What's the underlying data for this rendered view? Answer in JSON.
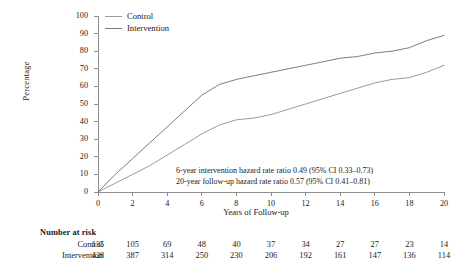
{
  "chart_data": {
    "type": "line",
    "title": "",
    "xlabel": "Years of Follow-up",
    "ylabel": "Percentage",
    "xlim": [
      0,
      20
    ],
    "ylim": [
      0,
      100
    ],
    "xticks": [
      0,
      2,
      4,
      6,
      8,
      10,
      12,
      14,
      16,
      18,
      20
    ],
    "yticks": [
      0,
      10,
      20,
      30,
      40,
      50,
      60,
      70,
      80,
      90,
      100
    ],
    "grid": false,
    "legend_position": "top-left",
    "x": [
      0,
      1,
      2,
      3,
      4,
      5,
      6,
      7,
      8,
      9,
      10,
      11,
      12,
      13,
      14,
      15,
      16,
      17,
      18,
      19,
      20
    ],
    "series": [
      {
        "name": "Control",
        "color": "#9a9a9a",
        "values": [
          0,
          5,
          10,
          15,
          21,
          27,
          33,
          38,
          41,
          42,
          44,
          47,
          50,
          53,
          56,
          59,
          62,
          64,
          65,
          68,
          72
        ]
      },
      {
        "name": "Intervention",
        "color": "#7d7d7d",
        "values": [
          0,
          10,
          19,
          28,
          37,
          46,
          55,
          61,
          64,
          66,
          68,
          70,
          72,
          74,
          76,
          77,
          79,
          80,
          82,
          86,
          89
        ]
      }
    ],
    "annotations": [
      "6-year intervention hazard rate ratio 0.49 (95% CI 0.33–0.73)",
      "20-year follow-up hazard rate ratio 0.57 (95% CI 0.41–0.81)"
    ]
  },
  "legend": {
    "items": [
      {
        "label": "Control"
      },
      {
        "label": "Intervention"
      }
    ]
  },
  "axes": {
    "y_title": "Percentage",
    "x_title": "Years of Follow-up",
    "y_ticks": [
      "100",
      "90",
      "80",
      "70",
      "60",
      "50",
      "40",
      "30",
      "20",
      "10",
      "0"
    ],
    "x_ticks": [
      "0",
      "2",
      "4",
      "6",
      "8",
      "10",
      "12",
      "14",
      "16",
      "18",
      "20"
    ]
  },
  "annotation": {
    "line1": "6-year intervention hazard rate ratio 0.49 (95% CI 0.33–0.73)",
    "line2": "20-year follow-up hazard rate ratio 0.57 (95% CI 0.41–0.81)"
  },
  "risk_table": {
    "title": "Number at risk",
    "rows": [
      {
        "label": "Control",
        "values": [
          "135",
          "105",
          "69",
          "48",
          "40",
          "37",
          "34",
          "27",
          "27",
          "23",
          "14"
        ]
      },
      {
        "label": "Intervention",
        "values": [
          "428",
          "387",
          "314",
          "250",
          "230",
          "206",
          "192",
          "161",
          "147",
          "136",
          "114"
        ]
      }
    ]
  },
  "colors": {
    "control": "#9a9a9a",
    "intervention": "#7d7d7d",
    "axis": "#8c8c8c",
    "text": "#1a1a1a"
  }
}
